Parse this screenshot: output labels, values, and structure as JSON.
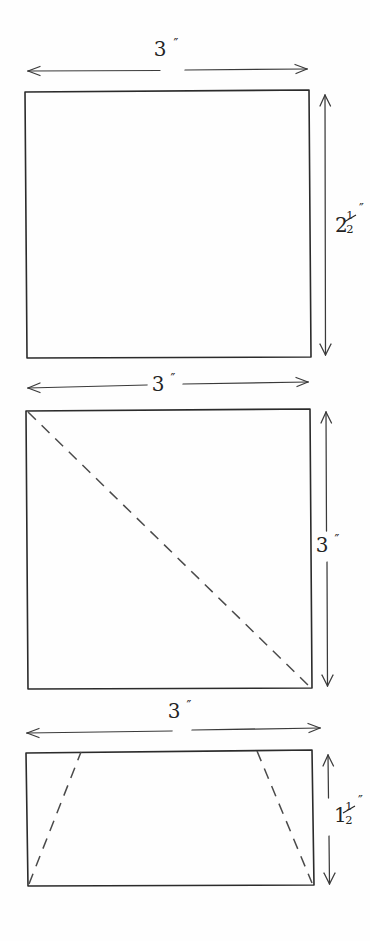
{
  "sheet": {
    "background_color": "#fefefe",
    "ink_color": "#2b2b2b",
    "dashed_ink_color": "#4a4a4a",
    "description": "Hand-drawn pencil sketch of three rectangular pattern pieces with dimension arrows"
  },
  "figures": [
    {
      "id": "figure-top",
      "shape": "rectangle",
      "width_label": {
        "whole": "3",
        "numerator": "",
        "denominator": "",
        "unit_mark": "″",
        "full_text": "3″",
        "position": "above-arrow",
        "placement": "top"
      },
      "height_label": {
        "whole": "2",
        "numerator": "1",
        "denominator": "2",
        "unit_mark": "″",
        "full_text": "2½″",
        "position": "beside-arrow",
        "placement": "right"
      },
      "interior_lines": []
    },
    {
      "id": "figure-middle",
      "shape": "square",
      "width_label": {
        "whole": "3",
        "numerator": "",
        "denominator": "",
        "unit_mark": "″",
        "full_text": "3″",
        "position": "inline-arrow",
        "placement": "top"
      },
      "height_label": {
        "whole": "3",
        "numerator": "",
        "denominator": "",
        "unit_mark": "″",
        "full_text": "3″",
        "position": "inline-arrow",
        "placement": "right"
      },
      "interior_lines": [
        {
          "style": "dashed",
          "from": "top-left-corner",
          "to": "bottom-right-corner",
          "name": "diagonal-fold-line"
        }
      ]
    },
    {
      "id": "figure-bottom",
      "shape": "rectangle",
      "width_label": {
        "whole": "3",
        "numerator": "",
        "denominator": "",
        "unit_mark": "″",
        "full_text": "3″",
        "position": "above-arrow",
        "placement": "top"
      },
      "height_label": {
        "whole": "1",
        "numerator": "1",
        "denominator": "2",
        "unit_mark": "″",
        "full_text": "1½″",
        "position": "beside-arrow",
        "placement": "right"
      },
      "interior_lines": [
        {
          "style": "dashed",
          "from": "bottom-left-corner",
          "to": "top-edge-left",
          "name": "left-taper-fold-line"
        },
        {
          "style": "dashed",
          "from": "bottom-right-corner",
          "to": "top-edge-right",
          "name": "right-taper-fold-line"
        }
      ]
    }
  ]
}
